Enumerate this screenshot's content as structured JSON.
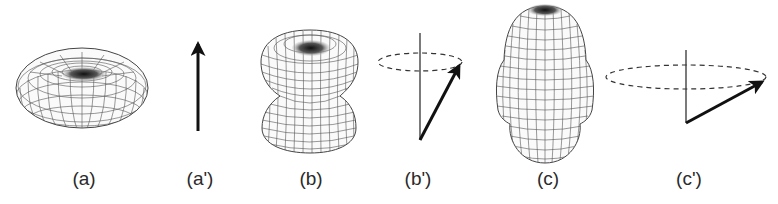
{
  "figure": {
    "panels": [
      {
        "id": "a",
        "label": "(a)",
        "kind": "oblate torus-like wireframe surface",
        "x": 84
      },
      {
        "id": "a_prime",
        "label": "(a')",
        "kind": "vertical arrow",
        "x": 200
      },
      {
        "id": "b",
        "label": "(b)",
        "kind": "two-lobed wireframe surface",
        "x": 311
      },
      {
        "id": "b_prime",
        "label": "(b')",
        "kind": "tilted arrow precessing on cone with dashed circle",
        "x": 418
      },
      {
        "id": "c",
        "label": "(c)",
        "kind": "elongated three-lobed wireframe surface",
        "x": 548
      },
      {
        "id": "c_prime",
        "label": "(c')",
        "kind": "strongly tilted arrow precessing on wide dashed circle",
        "x": 689
      }
    ]
  },
  "colors": {
    "background": "#ffffff",
    "ink": "#1a1a1a",
    "mesh": "#3a3a3a"
  }
}
